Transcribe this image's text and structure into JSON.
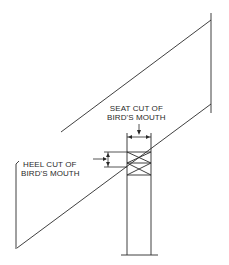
{
  "diagram": {
    "colors": {
      "line": "#2a2a2a",
      "background": "#ffffff"
    },
    "labels": {
      "seat_cut": {
        "line1": "SEAT CUT OF",
        "line2": "BIRD'S MOUTH"
      },
      "heel_cut": {
        "line1": "HEEL CUT OF",
        "line2": "BIRD'S MOUTH"
      }
    },
    "elements": [
      "rafter",
      "top-plate-post",
      "seat-cut-dimension",
      "heel-cut-dimension"
    ]
  }
}
